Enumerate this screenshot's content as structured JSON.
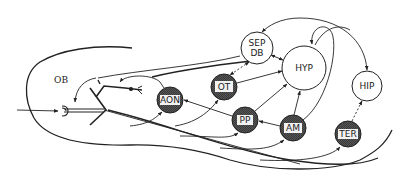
{
  "diagram": {
    "region_label": "OB",
    "colors": {
      "line": "#222222",
      "dark_node_fill": "#4a4a4a",
      "light_node_fill": "#ffffff",
      "label_box": "#f2f2f2"
    },
    "nodes": [
      {
        "id": "SEP_DB",
        "label_line1": "SEP",
        "label_line2": "DB",
        "style": "open"
      },
      {
        "id": "HYP",
        "label": "HYP",
        "style": "open"
      },
      {
        "id": "OT",
        "label": "OT",
        "style": "shaded"
      },
      {
        "id": "AON",
        "label": "AON",
        "style": "shaded"
      },
      {
        "id": "PP",
        "label": "PP",
        "style": "shaded"
      },
      {
        "id": "AM",
        "label": "AM",
        "style": "shaded"
      },
      {
        "id": "HIP",
        "label": "HIP",
        "style": "open"
      },
      {
        "id": "TER",
        "label": "TER",
        "style": "shaded"
      }
    ],
    "edges": [
      {
        "from": "SEP_DB",
        "to": "OB",
        "type": "solid"
      },
      {
        "from": "SEP_DB",
        "to": "OT",
        "type": "dashed",
        "bidirectional": true
      },
      {
        "from": "SEP_DB",
        "to": "HYP",
        "type": "solid",
        "bidirectional": true
      },
      {
        "from": "OT",
        "to": "HYP",
        "type": "solid"
      },
      {
        "from": "PP",
        "to": "HYP",
        "type": "solid"
      },
      {
        "from": "AM",
        "to": "HYP",
        "type": "solid"
      },
      {
        "from": "AM",
        "to": "HYP",
        "type": "solid",
        "curved": true
      },
      {
        "from": "AM",
        "to": "PP",
        "type": "solid"
      },
      {
        "from": "PP",
        "to": "AON",
        "type": "solid"
      },
      {
        "from": "AON",
        "to": "OB",
        "type": "solid"
      },
      {
        "from": "HIP",
        "to": "SEP_DB",
        "type": "solid"
      },
      {
        "from": "HIP",
        "to": "HYP",
        "type": "solid"
      },
      {
        "from": "TER",
        "to": "HIP",
        "type": "dashed"
      },
      {
        "from": "OB",
        "to": "AON",
        "type": "solid"
      },
      {
        "from": "OB",
        "to": "OT",
        "type": "solid"
      },
      {
        "from": "OB",
        "to": "PP",
        "type": "solid"
      },
      {
        "from": "OB",
        "to": "AM",
        "type": "solid"
      },
      {
        "from": "OB",
        "to": "TER",
        "type": "solid"
      }
    ]
  }
}
